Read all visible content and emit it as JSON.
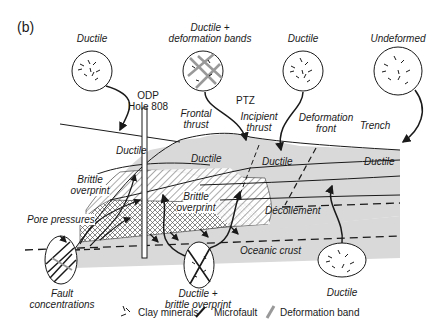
{
  "figure": {
    "panel_label": "(b)",
    "borehole": {
      "line1": "ODP",
      "line2": "Hole 808"
    },
    "insets": [
      {
        "id": "ductile-1",
        "label": "Ductile",
        "texture": "clay minerals"
      },
      {
        "id": "ductile-bands",
        "label_line1": "Ductile +",
        "label_line2": "deformation bands",
        "texture": "clay minerals + deformation bands"
      },
      {
        "id": "ductile-2",
        "label": "Ductile",
        "texture": "clay minerals"
      },
      {
        "id": "undeformed",
        "label": "Undeformed",
        "texture": "clay minerals"
      },
      {
        "id": "fault-concentrations",
        "label_line1": "Fault",
        "label_line2": "concentrations",
        "texture": "microfaults + deformation bands"
      },
      {
        "id": "ductile-brittle",
        "label_line1": "Ductile +",
        "label_line2": "brittle overprint",
        "texture": "clay minerals + microfaults"
      },
      {
        "id": "ductile-3",
        "label": "Ductile",
        "texture": "clay minerals"
      }
    ],
    "zone_labels": {
      "ptz": "PTZ",
      "frontal_thrust": {
        "line1": "Frontal",
        "line2": "thrust"
      },
      "incipient_thrust": {
        "line1": "Incipient",
        "line2": "thrust"
      },
      "deformation_front": {
        "line1": "Deformation",
        "line2": "front"
      },
      "trench": "Trench",
      "ductile_labels": [
        "Ductile",
        "Ductile",
        "Ductile",
        "Ductile"
      ],
      "brittle_overprint_1": {
        "line1": "Brittle",
        "line2": "overprint"
      },
      "brittle_overprint_2": {
        "line1": "Brittle",
        "line2": "overprint"
      },
      "pore_pressures": "Pore pressures",
      "decollement": "Décollement",
      "oceanic_crust": "Oceanic crust"
    },
    "legend": [
      {
        "symbol": "clay-minerals",
        "label": "Clay minerals"
      },
      {
        "symbol": "microfault",
        "label": "Microfault"
      },
      {
        "symbol": "deformation-band",
        "label": "Deformation band"
      }
    ],
    "colors": {
      "sediment_fill": "#d9d9d9",
      "line": "#1a1a1a",
      "deformation_band": "#999999",
      "background": "#ffffff"
    }
  }
}
